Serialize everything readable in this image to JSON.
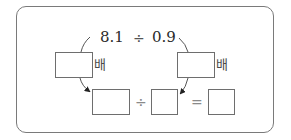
{
  "problem": {
    "dividend": "8.1",
    "divide_sign": "÷",
    "divisor": "0.9",
    "left_multiplier_unit": "배",
    "right_multiplier_unit": "배",
    "bottom_divide_sign": "÷",
    "equals_sign": "=",
    "left_multiplier_value": "",
    "right_multiplier_value": "",
    "new_dividend_value": "",
    "new_divisor_value": "",
    "quotient_value": ""
  },
  "colors": {
    "frame_border": "#7a7a7a",
    "box_border": "#6e6e6e",
    "text": "#2a2a2a"
  }
}
